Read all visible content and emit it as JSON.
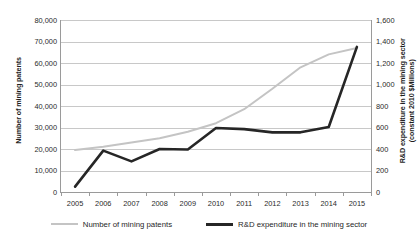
{
  "chart_data": {
    "type": "line",
    "title": "",
    "xlabel": "",
    "grid": true,
    "legend_position": "bottom",
    "categories": [
      "2005",
      "2006",
      "2007",
      "2008",
      "2009",
      "2010",
      "2011",
      "2012",
      "2013",
      "2014",
      "2015"
    ],
    "left_axis": {
      "label": "Number of mining patents",
      "ylim": [
        0,
        80000
      ],
      "ticks": [
        "0",
        "10,000",
        "20,000",
        "30,000",
        "40,000",
        "50,000",
        "60,000",
        "70,000",
        "80,000"
      ],
      "tick_values": [
        0,
        10000,
        20000,
        30000,
        40000,
        50000,
        60000,
        70000,
        80000
      ]
    },
    "right_axis": {
      "label_line1": "R&D expenditure in the mining sector",
      "label_line2": "(constant 2010 $Millions)",
      "ylim": [
        0,
        1600
      ],
      "ticks": [
        "0",
        "200",
        "400",
        "600",
        "800",
        "1,000",
        "1,200",
        "1,400",
        "1,600"
      ],
      "tick_values": [
        0,
        200,
        400,
        600,
        800,
        1000,
        1200,
        1400,
        1600
      ]
    },
    "series": [
      {
        "name": "Number of mining patents",
        "axis": "left",
        "color": "#c4c4c4",
        "values": [
          19500,
          21000,
          23000,
          25000,
          28000,
          32000,
          38500,
          48000,
          58000,
          64000,
          67000
        ]
      },
      {
        "name": "R&D expenditure in the mining sector",
        "axis": "right",
        "color": "#262626",
        "values": [
          50,
          385,
          285,
          400,
          395,
          595,
          585,
          555,
          555,
          605,
          1350
        ]
      }
    ]
  },
  "legend": {
    "items": [
      {
        "label": "Number of mining patents"
      },
      {
        "label": "R&D expenditure in the mining sector"
      }
    ]
  }
}
